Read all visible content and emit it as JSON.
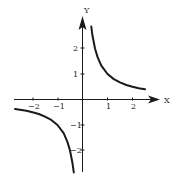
{
  "chart_data": {
    "type": "line",
    "title": "",
    "xlabel": "X",
    "ylabel": "Y",
    "function": "y = 1/x",
    "xlim": [
      -2.7,
      2.7
    ],
    "ylim": [
      -2.9,
      2.9
    ],
    "grid": false,
    "legend": null,
    "x_ticks": [
      -2,
      -1,
      1,
      2
    ],
    "y_ticks": [
      -2,
      -1,
      1,
      2
    ],
    "x_tick_labels": [
      "−2",
      "−1",
      "1",
      "2"
    ],
    "y_tick_labels": [
      "−2",
      "−1",
      "1",
      "2"
    ],
    "series": [
      {
        "name": "branch-positive",
        "x": [
          0.35,
          0.4,
          0.5,
          0.6,
          0.75,
          1.0,
          1.25,
          1.5,
          1.75,
          2.0,
          2.25,
          2.5
        ],
        "values": [
          2.86,
          2.5,
          2.0,
          1.67,
          1.33,
          1.0,
          0.8,
          0.67,
          0.57,
          0.5,
          0.44,
          0.4
        ]
      },
      {
        "name": "branch-negative",
        "x": [
          -2.7,
          -2.5,
          -2.25,
          -2.0,
          -1.75,
          -1.5,
          -1.25,
          -1.0,
          -0.75,
          -0.6,
          -0.5,
          -0.4,
          -0.35
        ],
        "values": [
          -0.37,
          -0.4,
          -0.44,
          -0.5,
          -0.57,
          -0.67,
          -0.8,
          -1.0,
          -1.33,
          -1.67,
          -2.0,
          -2.5,
          -2.86
        ]
      }
    ]
  },
  "axes": {
    "x_label": "X",
    "y_label": "Y",
    "x_ticks": [
      "−2",
      "−1",
      "1",
      "2"
    ],
    "y_ticks": [
      "2",
      "1",
      "−1",
      "−2"
    ]
  }
}
